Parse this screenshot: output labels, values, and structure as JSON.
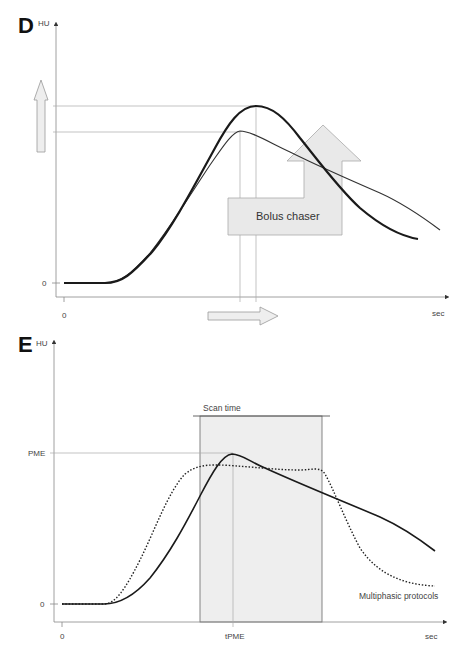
{
  "panels": [
    {
      "letter": "D",
      "y_unit": "HU",
      "x_unit": "sec",
      "y_zero_label": "0",
      "x_zero_label": "0",
      "annotation": "Bolus chaser",
      "curves": [
        {
          "name": "with-bolus-chaser",
          "style": "thick-solid",
          "color": "#1a1a1a"
        },
        {
          "name": "without-bolus-chaser",
          "style": "thin-solid",
          "color": "#333333"
        }
      ],
      "arrows": [
        {
          "name": "enhancement-increase-arrow",
          "direction": "up"
        },
        {
          "name": "peak-delay-arrow",
          "direction": "right"
        },
        {
          "name": "bolus-chaser-arrow",
          "direction": "right-then-up"
        }
      ]
    },
    {
      "letter": "E",
      "y_unit": "HU",
      "x_unit": "sec",
      "y_zero_label": "0",
      "x_zero_label": "0",
      "y_peak_label": "PME",
      "x_peak_label": "tPME",
      "scan_window_label": "Scan time",
      "legend_label": "Multiphasic protocols",
      "curves": [
        {
          "name": "uniphasic",
          "style": "solid",
          "color": "#1a1a1a"
        },
        {
          "name": "multiphasic",
          "style": "dotted",
          "color": "#1a1a1a"
        }
      ],
      "colors": {
        "scan_window_fill": "#eeeeee",
        "guide": "#999999"
      }
    }
  ]
}
